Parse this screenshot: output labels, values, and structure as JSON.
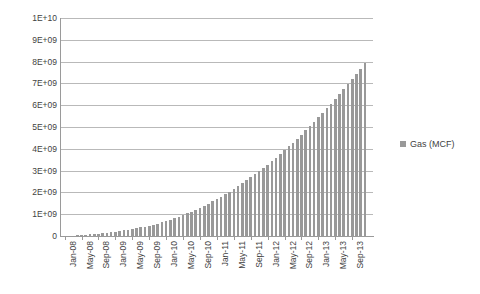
{
  "chart_data": {
    "type": "bar",
    "title": "",
    "subtitle": "",
    "xlabel": "",
    "ylabel": "",
    "grid": true,
    "legend_position": "right",
    "ylim": [
      0,
      10000000000
    ],
    "ytick_labels": [
      "1E+10",
      "9E+09",
      "8E+09",
      "7E+09",
      "6E+09",
      "5E+09",
      "4E+09",
      "3E+09",
      "2E+09",
      "1E+09",
      "0"
    ],
    "ytick_values": [
      10000000000,
      9000000000,
      8000000000,
      7000000000,
      6000000000,
      5000000000,
      4000000000,
      3000000000,
      2000000000,
      1000000000,
      0
    ],
    "xtick_labels": [
      "Jan-08",
      "May-08",
      "Sep-08",
      "Jan-09",
      "May-09",
      "Sep-09",
      "Jan-10",
      "May-10",
      "Sep-10",
      "Jan-11",
      "May-11",
      "Sep-11",
      "Jan-12",
      "May-12",
      "Sep-12",
      "Jan-13",
      "May-13",
      "Sep-13"
    ],
    "xtick_interval_months": 4,
    "series": [
      {
        "name": "Gas (MCF)",
        "color": "#999999",
        "categories": [
          "Jan-08",
          "Feb-08",
          "Mar-08",
          "Apr-08",
          "May-08",
          "Jun-08",
          "Jul-08",
          "Aug-08",
          "Sep-08",
          "Oct-08",
          "Nov-08",
          "Dec-08",
          "Jan-09",
          "Feb-09",
          "Mar-09",
          "Apr-09",
          "May-09",
          "Jun-09",
          "Jul-09",
          "Aug-09",
          "Sep-09",
          "Oct-09",
          "Nov-09",
          "Dec-09",
          "Jan-10",
          "Feb-10",
          "Mar-10",
          "Apr-10",
          "May-10",
          "Jun-10",
          "Jul-10",
          "Aug-10",
          "Sep-10",
          "Oct-10",
          "Nov-10",
          "Dec-10",
          "Jan-11",
          "Feb-11",
          "Mar-11",
          "Apr-11",
          "May-11",
          "Jun-11",
          "Jul-11",
          "Aug-11",
          "Sep-11",
          "Oct-11",
          "Nov-11",
          "Dec-11",
          "Jan-12",
          "Feb-12",
          "Mar-12",
          "Apr-12",
          "May-12",
          "Jun-12",
          "Jul-12",
          "Aug-12",
          "Sep-12",
          "Oct-12",
          "Nov-12",
          "Dec-12",
          "Jan-13",
          "Feb-13",
          "Mar-13",
          "Apr-13",
          "May-13",
          "Jun-13",
          "Jul-13",
          "Aug-13",
          "Sep-13",
          "Oct-13",
          "Nov-13",
          "Dec-13"
        ],
        "values": [
          5000000,
          12000000,
          20000000,
          30000000,
          42000000,
          55000000,
          70000000,
          86000000,
          104000000,
          124000000,
          146000000,
          170000000,
          196000000,
          224000000,
          254000000,
          286000000,
          320000000,
          356000000,
          394000000,
          434000000,
          478000000,
          524000000,
          574000000,
          628000000,
          686000000,
          748000000,
          814000000,
          884000000,
          958000000,
          1036000000,
          1118000000,
          1204000000,
          1294000000,
          1388000000,
          1486000000,
          1588000000,
          1694000000,
          1804000000,
          1918000000,
          2036000000,
          2158000000,
          2284000000,
          2414000000,
          2548000000,
          2686000000,
          2828000000,
          2974000000,
          3124000000,
          3278000000,
          3436000000,
          3598000000,
          3764000000,
          3934000000,
          4108000000,
          4286000000,
          4468000000,
          4654000000,
          4844000000,
          5038000000,
          5236000000,
          5438000000,
          5644000000,
          5854000000,
          6068000000,
          6286000000,
          6508000000,
          6734000000,
          6964000000,
          7198000000,
          7436000000,
          7678000000,
          7924000000
        ]
      }
    ]
  },
  "legend": {
    "label": "Gas (MCF)"
  }
}
